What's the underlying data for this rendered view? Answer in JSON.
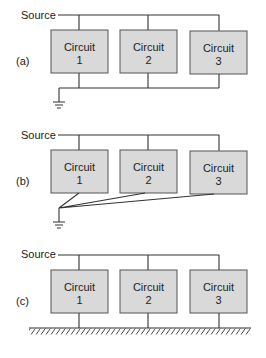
{
  "panels": [
    {
      "id": "a",
      "label": "(a)",
      "source_label": "Source",
      "grounding": "common-bus-single-ground",
      "circuits": [
        {
          "line1": "Circuit",
          "line2": "1"
        },
        {
          "line1": "Circuit",
          "line2": "2"
        },
        {
          "line1": "Circuit",
          "line2": "3"
        }
      ]
    },
    {
      "id": "b",
      "label": "(b)",
      "source_label": "Source",
      "grounding": "star-single-point-ground",
      "circuits": [
        {
          "line1": "Circuit",
          "line2": "1"
        },
        {
          "line1": "Circuit",
          "line2": "2"
        },
        {
          "line1": "Circuit",
          "line2": "3"
        }
      ]
    },
    {
      "id": "c",
      "label": "(c)",
      "source_label": "Source",
      "grounding": "ground-plane",
      "circuits": [
        {
          "line1": "Circuit",
          "line2": "1"
        },
        {
          "line1": "Circuit",
          "line2": "2"
        },
        {
          "line1": "Circuit",
          "line2": "3"
        }
      ]
    }
  ],
  "colors": {
    "box_fill": "#d9d9d9",
    "box_stroke": "#555555",
    "wire": "#333333"
  }
}
